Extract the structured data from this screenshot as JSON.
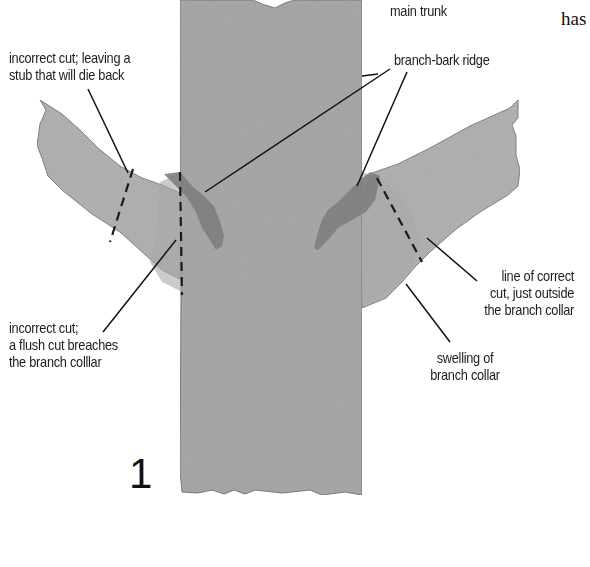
{
  "diagram": {
    "figure_number": "1",
    "corner_text": "has",
    "labels": {
      "main_trunk": "main trunk",
      "branch_bark_ridge": "branch-bark ridge",
      "stub_cut": [
        "incorrect cut; leaving a",
        "stub that will die back"
      ],
      "flush_cut": [
        "incorrect cut;",
        "a flush cut breaches",
        "the branch colllar"
      ],
      "correct_cut": [
        "line of correct",
        "cut, just outside",
        "the branch collar"
      ],
      "swelling": [
        "swelling of",
        "branch collar"
      ]
    },
    "colors": {
      "trunk": "#a3a3a3",
      "branch": "#ababab",
      "ridge": "#7d7d7d",
      "outline": "#6a6a6a",
      "leader": "#111111",
      "background": "#ffffff"
    }
  }
}
